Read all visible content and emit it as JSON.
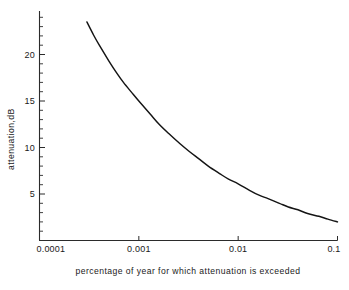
{
  "chart_data": {
    "type": "line",
    "title": "",
    "xlabel": "percentage of year for which attenuation is exceeded",
    "ylabel": "attenuation,dB",
    "xscale": "log",
    "yscale": "linear",
    "xlim": [
      0.0001,
      0.1
    ],
    "ylim": [
      0,
      24
    ],
    "grid": false,
    "legend": "none",
    "x_ticklabels": [
      "0.0001",
      "0.001",
      "0.01",
      "0.1"
    ],
    "x_tickvalues": [
      0.0001,
      0.001,
      0.01,
      0.1
    ],
    "y_ticklabels": [
      "5",
      "10",
      "15",
      "20"
    ],
    "y_tickvalues": [
      5,
      10,
      15,
      20
    ],
    "y_minor_step": 1,
    "series": [
      {
        "name": "attenuation",
        "color": "#141414",
        "x": [
          0.0003,
          0.00035,
          0.0004,
          0.0005,
          0.0006,
          0.0007,
          0.00085,
          0.001,
          0.0013,
          0.0016,
          0.002,
          0.0026,
          0.0032,
          0.004,
          0.005,
          0.0065,
          0.008,
          0.01,
          0.013,
          0.016,
          0.02,
          0.026,
          0.032,
          0.04,
          0.05,
          0.065,
          0.08,
          0.1
        ],
        "y": [
          23.5,
          22.1,
          21.0,
          19.3,
          18.0,
          17.0,
          15.9,
          15.0,
          13.6,
          12.5,
          11.5,
          10.4,
          9.6,
          8.8,
          8.0,
          7.2,
          6.6,
          6.1,
          5.4,
          4.9,
          4.5,
          4.0,
          3.6,
          3.3,
          2.9,
          2.6,
          2.3,
          2.0
        ]
      }
    ]
  },
  "axes": {
    "y_axis_title": "attenuation,dB",
    "x_axis_title": "percentage of year for which attenuation is exceeded"
  }
}
